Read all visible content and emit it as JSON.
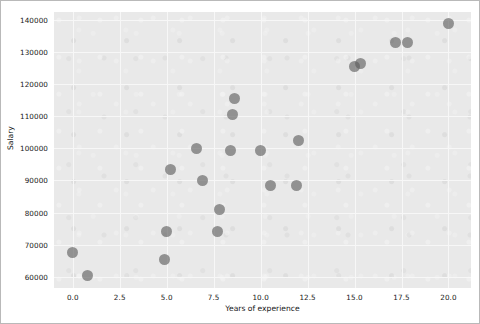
{
  "chart_data": {
    "type": "scatter",
    "title": "",
    "xlabel": "Years of experience",
    "ylabel": "Salary",
    "xlim": [
      -1.0,
      21.2
    ],
    "ylim": [
      56500,
      142500
    ],
    "grid": true,
    "legend": "none",
    "marker": {
      "color": "#5a5a5a",
      "opacity": 0.62,
      "size": 11,
      "shape": "circle"
    },
    "background": {
      "figure": "#ffffff",
      "axes": "#e9e9e9",
      "gridline": "#f7f7f7",
      "border": "#b9b9b9"
    },
    "xticks": [
      "0.0",
      "2.5",
      "5.0",
      "7.5",
      "10.0",
      "12.5",
      "15.0",
      "17.5",
      "20.0"
    ],
    "xtick_values": [
      0.0,
      2.5,
      5.0,
      7.5,
      10.0,
      12.5,
      15.0,
      17.5,
      20.0
    ],
    "yticks": [
      "60000",
      "70000",
      "80000",
      "90000",
      "100000",
      "110000",
      "120000",
      "130000",
      "140000"
    ],
    "ytick_values": [
      60000,
      70000,
      80000,
      90000,
      100000,
      110000,
      120000,
      130000,
      140000
    ],
    "points": [
      {
        "x": 0.0,
        "y": 67500
      },
      {
        "x": 0.8,
        "y": 60500
      },
      {
        "x": 4.9,
        "y": 65500
      },
      {
        "x": 5.0,
        "y": 74000
      },
      {
        "x": 5.2,
        "y": 93500
      },
      {
        "x": 6.6,
        "y": 100000
      },
      {
        "x": 6.9,
        "y": 90000
      },
      {
        "x": 7.7,
        "y": 74000
      },
      {
        "x": 7.8,
        "y": 81000
      },
      {
        "x": 8.4,
        "y": 99500
      },
      {
        "x": 8.5,
        "y": 110500
      },
      {
        "x": 8.6,
        "y": 115500
      },
      {
        "x": 10.0,
        "y": 99500
      },
      {
        "x": 10.5,
        "y": 88500
      },
      {
        "x": 11.9,
        "y": 88500
      },
      {
        "x": 12.0,
        "y": 102500
      },
      {
        "x": 15.0,
        "y": 125500
      },
      {
        "x": 15.3,
        "y": 126500
      },
      {
        "x": 17.2,
        "y": 133000
      },
      {
        "x": 17.8,
        "y": 133000
      },
      {
        "x": 20.0,
        "y": 139000
      }
    ]
  }
}
